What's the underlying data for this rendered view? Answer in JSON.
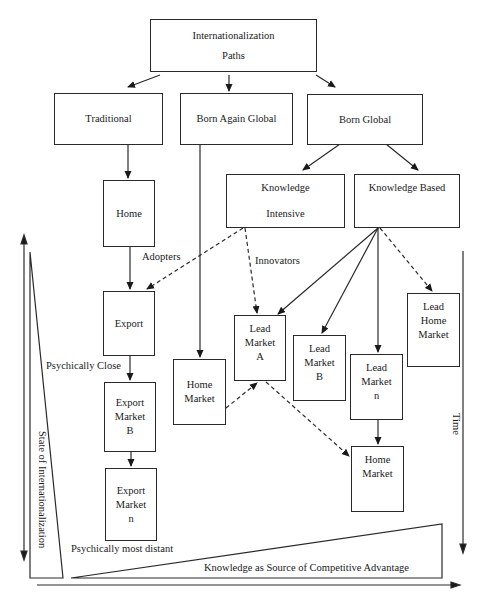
{
  "diagram": {
    "root": {
      "line1": "Internationalization",
      "line2": "Paths"
    },
    "paths": {
      "traditional": "Traditional",
      "born_again_global": "Born Again Global",
      "born_global": "Born Global"
    },
    "born_global_types": {
      "knowledge_intensive": {
        "line1": "Knowledge",
        "line2": "Intensive"
      },
      "knowledge_based": "Knowledge Based"
    },
    "traditional_chain": {
      "home": "Home",
      "export": "Export",
      "export_market_b": {
        "line1": "Export",
        "line2": "Market",
        "line3": "B"
      },
      "export_market_n": {
        "line1": "Export",
        "line2": "Market",
        "line3": "n"
      }
    },
    "born_again_chain": {
      "home_market": {
        "line1": "Home",
        "line2": "Market"
      }
    },
    "lead_markets": {
      "a": {
        "line1": "Lead",
        "line2": "Market",
        "line3": "A"
      },
      "b": {
        "line1": "Lead",
        "line2": "Market",
        "line3": "B"
      },
      "n": {
        "line1": "Lead",
        "line2": "Market",
        "line3": "n"
      },
      "home": {
        "line1": "Lead",
        "line2": "Home",
        "line3": "Market"
      }
    },
    "born_global_home_market": {
      "line1": "Home",
      "line2": "Market"
    },
    "labels": {
      "adopters": "Adopters",
      "innovators": "Innovators",
      "psychically_close": "Psychically Close",
      "psychically_most_distant": "Psychically most distant",
      "state_of_internationalization": "State of Internationalization",
      "time": "Time",
      "knowledge_advantage": "Knowledge as Source of Competitive Advantage"
    },
    "colors": {
      "line": "#2a2a2a",
      "background": "#ffffff"
    }
  }
}
